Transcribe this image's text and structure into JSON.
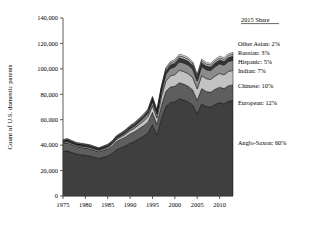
{
  "chart_data": {
    "type": "area",
    "stacked": true,
    "title": "",
    "xlabel": "",
    "ylabel": "Count of U.S. domestic patents",
    "xlim": [
      1975,
      2013
    ],
    "ylim": [
      0,
      140000
    ],
    "ytick_labels": [
      "0",
      "20,000",
      "40,000",
      "60,000",
      "80,000",
      "100,000",
      "120,000",
      "140,000"
    ],
    "ytick_values": [
      0,
      20000,
      40000,
      60000,
      80000,
      100000,
      120000,
      140000
    ],
    "xtick_labels": [
      "1975",
      "1980",
      "1985",
      "1990",
      "1995",
      "2000",
      "2005",
      "2010"
    ],
    "xtick_values": [
      1975,
      1980,
      1985,
      1990,
      1995,
      2000,
      2005,
      2010
    ],
    "grid": false,
    "legend_position": "right-annotations",
    "legend_header": "2015 Share",
    "x": [
      1975,
      1976,
      1977,
      1978,
      1979,
      1980,
      1981,
      1982,
      1983,
      1984,
      1985,
      1986,
      1987,
      1988,
      1989,
      1990,
      1991,
      1992,
      1993,
      1994,
      1995,
      1996,
      1997,
      1998,
      1999,
      2000,
      2001,
      2002,
      2003,
      2004,
      2005,
      2006,
      2007,
      2008,
      2009,
      2010,
      2011,
      2012,
      2013
    ],
    "series": [
      {
        "name": "Anglo-Saxon",
        "share_2015": "60%",
        "color": "#3f3f3f",
        "values": [
          35000,
          35500,
          34200,
          33000,
          32500,
          32000,
          31500,
          30500,
          29500,
          30500,
          31500,
          33500,
          36500,
          38000,
          39500,
          41500,
          43000,
          45000,
          47000,
          49500,
          56000,
          48000,
          61000,
          70500,
          73500,
          74000,
          76500,
          75500,
          74000,
          71500,
          64500,
          72500,
          70500,
          70000,
          72000,
          73500,
          72500,
          74500,
          75000
        ]
      },
      {
        "name": "European",
        "share_2015": "12%",
        "color": "#5e5e5e",
        "values": [
          6200,
          6300,
          6100,
          5900,
          5800,
          5700,
          5600,
          5400,
          5300,
          5400,
          5600,
          5900,
          6400,
          6700,
          7000,
          7300,
          7500,
          7900,
          8200,
          8600,
          9700,
          8400,
          10400,
          11800,
          12200,
          12300,
          12600,
          12500,
          12300,
          11900,
          10800,
          12000,
          11700,
          11600,
          11900,
          12100,
          12000,
          12300,
          12400
        ]
      },
      {
        "name": "Chinese",
        "share_2015": "10%",
        "color": "#c2c2c2",
        "values": [
          900,
          950,
          950,
          950,
          950,
          1000,
          1000,
          1000,
          1000,
          1100,
          1200,
          1400,
          1700,
          1900,
          2200,
          2600,
          2900,
          3300,
          3800,
          4300,
          5400,
          4900,
          6600,
          8200,
          8800,
          9200,
          9800,
          9900,
          9900,
          9700,
          9000,
          10200,
          10100,
          10100,
          10500,
          10800,
          10800,
          11200,
          11400
        ]
      },
      {
        "name": "Indian",
        "share_2015": "7%",
        "color": "#8c8c8c",
        "values": [
          500,
          520,
          520,
          520,
          530,
          540,
          550,
          560,
          570,
          620,
          680,
          780,
          920,
          1050,
          1250,
          1500,
          1700,
          2000,
          2300,
          2700,
          3400,
          3100,
          4200,
          5300,
          5800,
          6100,
          6600,
          6700,
          6800,
          6700,
          6200,
          7100,
          7000,
          7000,
          7300,
          7600,
          7600,
          7900,
          8000
        ]
      },
      {
        "name": "Hispanic",
        "share_2015": "5%",
        "color": "#343434",
        "values": [
          900,
          910,
          890,
          870,
          860,
          850,
          840,
          820,
          810,
          840,
          880,
          940,
          1040,
          1110,
          1200,
          1300,
          1380,
          1480,
          1580,
          1700,
          1950,
          1700,
          2200,
          2600,
          2750,
          2850,
          3000,
          3000,
          2950,
          2870,
          2600,
          2900,
          2850,
          2830,
          2900,
          2980,
          2950,
          3030,
          3060
        ]
      },
      {
        "name": "Russian",
        "share_2015": "3%",
        "color": "#ababab",
        "values": [
          560,
          570,
          550,
          540,
          530,
          520,
          515,
          500,
          490,
          510,
          535,
          575,
          635,
          680,
          730,
          790,
          840,
          900,
          960,
          1030,
          1180,
          1030,
          1330,
          1570,
          1660,
          1720,
          1810,
          1810,
          1780,
          1730,
          1570,
          1750,
          1720,
          1710,
          1750,
          1800,
          1780,
          1830,
          1850
        ]
      },
      {
        "name": "Other Asian",
        "share_2015": "2%",
        "color": "#f2f2f2",
        "values": [
          380,
          385,
          372,
          364,
          358,
          352,
          347,
          338,
          330,
          344,
          361,
          388,
          428,
          458,
          492,
          533,
          566,
          607,
          648,
          695,
          796,
          695,
          897,
          1059,
          1119,
          1161,
          1221,
          1221,
          1201,
          1167,
          1059,
          1181,
          1161,
          1154,
          1181,
          1214,
          1201,
          1234,
          1248
        ]
      }
    ]
  },
  "annotations": {
    "header": "2015 Share",
    "items": [
      {
        "label": "Other Asian: 2%"
      },
      {
        "label": "Russian: 3%"
      },
      {
        "label": "Hispanic: 5%"
      },
      {
        "label": "Indian: 7%"
      },
      {
        "label": "Chinese: 10%"
      },
      {
        "label": "European: 12%"
      },
      {
        "label": "Anglo-Saxon: 60%"
      }
    ]
  }
}
